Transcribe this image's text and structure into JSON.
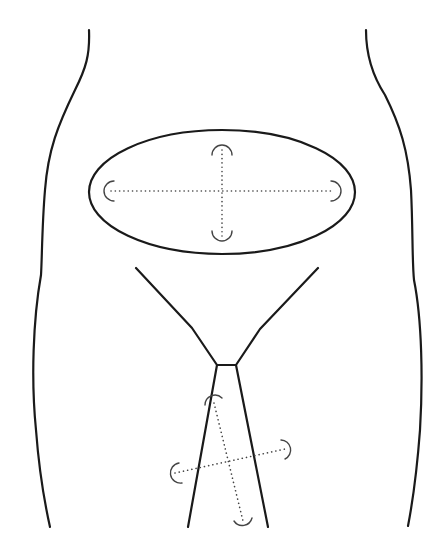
{
  "figure": {
    "title": "",
    "stroke_color": "#1a1a1a",
    "dotted_color": "#444444",
    "background": "#ffffff",
    "parts": [
      {
        "name": "left-body-outline"
      },
      {
        "name": "right-body-outline"
      },
      {
        "name": "elliptical-region",
        "measurement_axes": [
          "horizontal",
          "vertical"
        ]
      },
      {
        "name": "v-shaped-outline"
      },
      {
        "name": "tapered-strip",
        "measurement_axes": [
          "diagonal-long",
          "diagonal-short"
        ]
      }
    ]
  }
}
